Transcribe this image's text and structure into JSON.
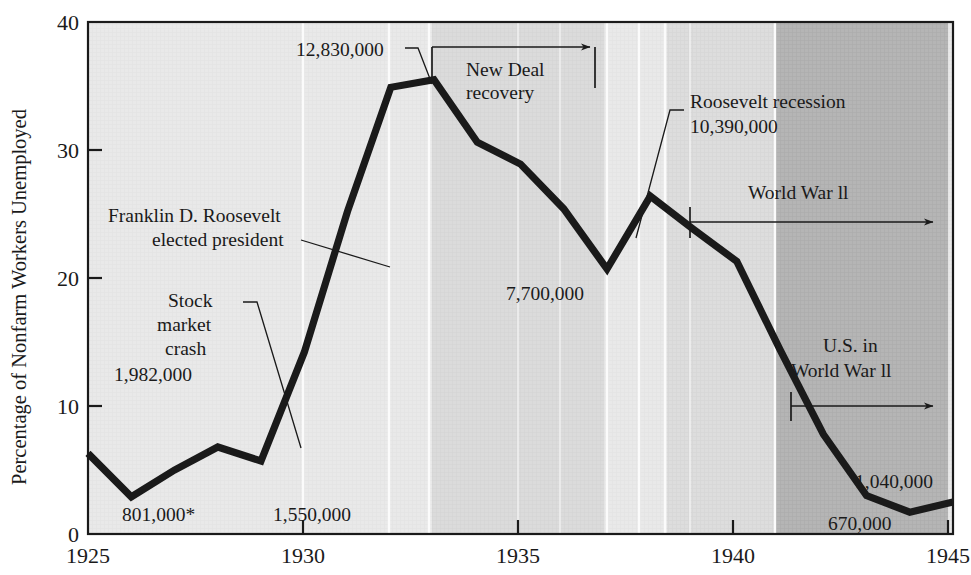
{
  "chart_data": {
    "type": "line",
    "title": "",
    "xlabel": "",
    "ylabel": "Percentage of Nonfarm Workers Unemployed",
    "xlim": [
      1925,
      1945
    ],
    "ylim": [
      0,
      40
    ],
    "grid": false,
    "legend": "none",
    "x_ticks": [
      "1925",
      "1930",
      "1935",
      "1940",
      "1945"
    ],
    "y_ticks": [
      "0",
      "10",
      "20",
      "30",
      "40"
    ],
    "x": [
      1925,
      1926,
      1927,
      1928,
      1929,
      1930,
      1931,
      1932,
      1933,
      1934,
      1935,
      1936,
      1937,
      1938,
      1939,
      1940,
      1941,
      1942,
      1943,
      1944,
      1945
    ],
    "values": [
      6.3,
      2.9,
      5.0,
      6.8,
      5.7,
      14.2,
      25.2,
      34.9,
      35.5,
      30.6,
      28.9,
      25.4,
      20.7,
      26.4,
      23.8,
      21.3,
      14.4,
      7.8,
      3.0,
      1.7,
      2.5
    ],
    "series": [
      {
        "name": "Percentage of nonfarm workers unemployed",
        "values": [
          6.3,
          2.9,
          5.0,
          6.8,
          5.7,
          14.2,
          25.2,
          34.9,
          35.5,
          30.6,
          28.9,
          25.4,
          20.7,
          26.4,
          23.8,
          21.3,
          14.4,
          7.8,
          3.0,
          1.7,
          2.5
        ]
      }
    ],
    "shaded_bands": [
      {
        "name": "new-deal-recovery-band",
        "from": 1933,
        "to": 1937,
        "color": "#d7d7d7"
      },
      {
        "name": "world-war-two-band",
        "from": 1939.5,
        "to": 1942,
        "color": "#d0d0d0"
      },
      {
        "name": "us-in-world-war-two-band",
        "from": 1942,
        "to": 1945,
        "color": "#aeaeae"
      }
    ],
    "plot_background": "#e9e9e9"
  },
  "axis": {
    "y_title": "Percentage of Nonfarm Workers Unemployed",
    "y_ticks": [
      "40",
      "30",
      "20",
      "10",
      "0"
    ],
    "x_ticks": [
      "1925",
      "1930",
      "1935",
      "1940",
      "1945"
    ]
  },
  "annotations": {
    "peak": {
      "value_label": "12,830,000",
      "year": 1933
    },
    "new_deal": {
      "line1": "New Deal",
      "line2": "recovery",
      "from_year": 1933,
      "to_year": 1937
    },
    "roosevelt_elected": {
      "line1": "Franklin D. Roosevelt",
      "line2": "elected president"
    },
    "stock_crash": {
      "line1": "Stock",
      "line2": "market",
      "line3": "crash",
      "value_label": "1,982,000"
    },
    "trough_1926": {
      "value_label": "801,000*"
    },
    "year_1929": {
      "value_label": "1,550,000"
    },
    "trough_1937": {
      "value_label": "7,700,000"
    },
    "roosevelt_recession": {
      "line1": "Roosevelt recession",
      "value_label": "10,390,000"
    },
    "world_war_two": {
      "label": "World War ll",
      "from_year": 1939.5,
      "to_year": 1945
    },
    "us_in_world_war_two": {
      "line1": "U.S. in",
      "line2": "World War ll",
      "from_year": 1942,
      "to_year": 1945
    },
    "end_1945": {
      "value_label": "1,040,000"
    },
    "min_1944": {
      "value_label": "670,000"
    }
  },
  "colors": {
    "line": "#1a1a1a",
    "frame": "#1a1a1a",
    "plot_bg": "#e9e9e9",
    "band_light": "#d7d7d7",
    "band_mid": "#d0d0d0",
    "band_dark": "#aeaeae",
    "page_bg": "#ffffff"
  }
}
